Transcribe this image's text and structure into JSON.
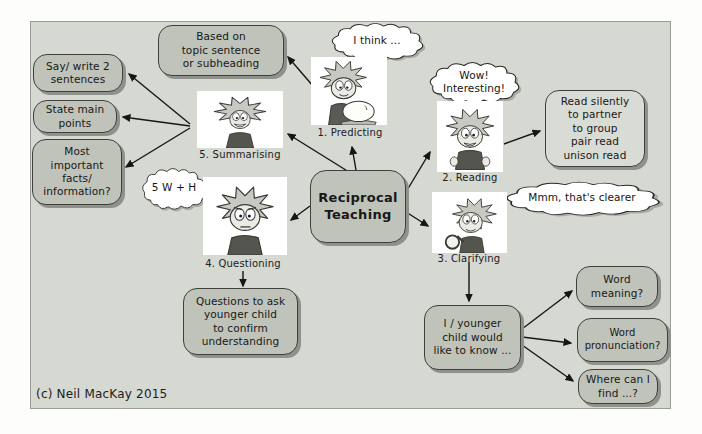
{
  "page": {
    "copyright": "(c) Neil MacKay 2015"
  },
  "center": {
    "label": "Reciprocal\nTeaching"
  },
  "steps": {
    "predicting": {
      "caption": "1. Predicting",
      "bubble": "I think ...",
      "illustration": "child-gazing-into-crystal-ball"
    },
    "reading": {
      "caption": "2. Reading",
      "bubble": "Wow!\nInteresting!",
      "box": "Read silently\nto partner\nto group\npair read\nunison read",
      "illustration": "child-reading-excitedly"
    },
    "clarifying": {
      "caption": "3. Clarifying",
      "bubble": "Mmm, that's clearer",
      "box": "I / younger\nchild would\nlike to know ...",
      "branches": [
        "Word\nmeaning?",
        "Word\npronunciation?",
        "Where can I\nfind ...?"
      ],
      "illustration": "child-with-magnifying-glass"
    },
    "questioning": {
      "caption": "4. Questioning",
      "bubble": "5 W + H",
      "box": "Questions to ask\nyounger child\nto confirm\nunderstanding",
      "illustration": "puzzled-child"
    },
    "summarising": {
      "caption": "5. Summarising",
      "top_box": "Based on\ntopic sentence\nor subheading",
      "boxes": [
        "Say/ write 2\nsentences",
        "State main\npoints",
        "Most\nimportant\nfacts/\ninformation?"
      ],
      "illustration": "smiling-wild-haired-child"
    }
  },
  "colors": {
    "frame_background": "#d6d8d2",
    "box_fill": "#bfc3ba",
    "light_box_fill": "#d9dbd5",
    "box_border": "#3f403c",
    "shadow": "#8f918c",
    "arrow": "#161614",
    "page_background": "#fdfdfb"
  }
}
